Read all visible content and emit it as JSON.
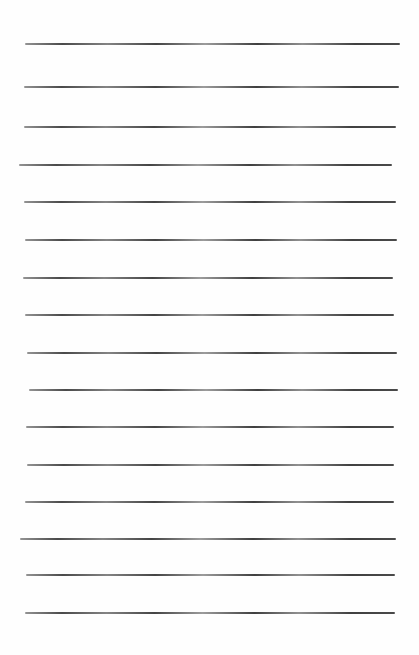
{
  "document": {
    "type": "lined paper",
    "background_color": "#fefefe",
    "line_color": "#444444",
    "lines": [
      {
        "y": 44,
        "x1": 25,
        "x2": 400
      },
      {
        "y": 87,
        "x1": 24,
        "x2": 399
      },
      {
        "y": 127,
        "x1": 24,
        "x2": 396
      },
      {
        "y": 165,
        "x1": 19,
        "x2": 392
      },
      {
        "y": 202,
        "x1": 24,
        "x2": 396
      },
      {
        "y": 240,
        "x1": 25,
        "x2": 397
      },
      {
        "y": 278,
        "x1": 23,
        "x2": 393
      },
      {
        "y": 315,
        "x1": 25,
        "x2": 394
      },
      {
        "y": 353,
        "x1": 27,
        "x2": 397
      },
      {
        "y": 390,
        "x1": 29,
        "x2": 398
      },
      {
        "y": 427,
        "x1": 26,
        "x2": 394
      },
      {
        "y": 465,
        "x1": 27,
        "x2": 394
      },
      {
        "y": 502,
        "x1": 25,
        "x2": 394
      },
      {
        "y": 539,
        "x1": 20,
        "x2": 396
      },
      {
        "y": 575,
        "x1": 26,
        "x2": 395
      },
      {
        "y": 613,
        "x1": 25,
        "x2": 395
      }
    ]
  }
}
